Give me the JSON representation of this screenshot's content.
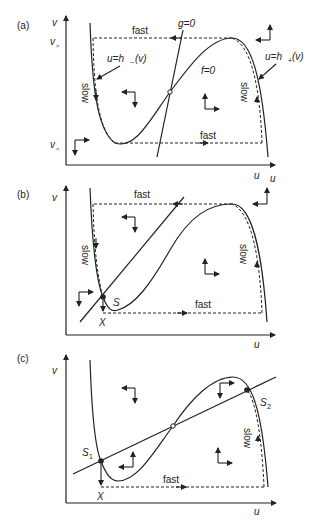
{
  "figure": {
    "panels": [
      {
        "id": "a",
        "label": "(a)",
        "y_axis_label": "v",
        "x_axis_label": "u",
        "y_ticks": {
          "v_upper": "v",
          "v_upper_sub": ">",
          "v_lower": "v",
          "v_lower_sub": "<"
        },
        "fast_top_label": "fast",
        "fast_bottom_label": "fast",
        "slow_left_label": "slow",
        "slow_right_label": "slow",
        "g_nullcline_label": "g=0",
        "f_nullcline_label": "f=0",
        "left_branch_label": "u=h_(v)",
        "left_branch_label_main": "u=h",
        "left_branch_label_sub": "−",
        "left_branch_label_arg": "(v)",
        "right_branch_label_main": "u=h",
        "right_branch_label_sub": "+",
        "right_branch_label_arg": "(v)"
      },
      {
        "id": "b",
        "label": "(b)",
        "y_axis_label": "v",
        "x_axis_label": "u",
        "fast_top_label": "fast",
        "fast_bottom_label": "fast",
        "slow_left_label": "slow",
        "slow_right_label": "slow",
        "stable_point_label": "S",
        "x_point_label": "X"
      },
      {
        "id": "c",
        "label": "(c)",
        "y_axis_label": "v",
        "x_axis_label": "u",
        "fast_bottom_label": "fast",
        "slow_right_label": "slow",
        "s1_label": "S",
        "s1_sub": "1",
        "s2_label": "S",
        "s2_sub": "2",
        "x_point_label": "X"
      }
    ]
  }
}
